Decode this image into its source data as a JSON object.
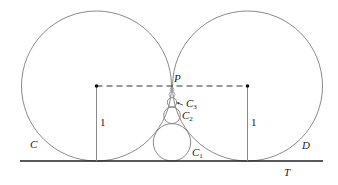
{
  "diagram": {
    "labels": {
      "circle_left": "C",
      "circle_right": "D",
      "tangent_line": "T",
      "tangency_point": "P",
      "small_circle_1": "C",
      "small_circle_1_sub": "1",
      "small_circle_2": "C",
      "small_circle_2_sub": "2",
      "small_circle_3": "C",
      "small_circle_3_sub": "3",
      "radius_left": "1",
      "radius_right": "1"
    },
    "colors": {
      "circle_stroke": "#8a8a8a",
      "line_stroke": "#222222",
      "dashed_stroke": "#333333"
    }
  }
}
